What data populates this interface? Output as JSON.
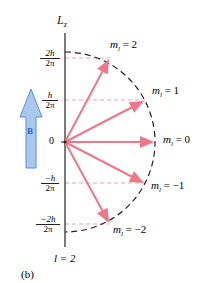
{
  "diagram": {
    "axis_label": "L",
    "axis_label_sub": "z",
    "field_label": "B",
    "quantum_number_label": "l = 2",
    "panel_label": "(b)",
    "tick_labels": [
      {
        "num": "2h",
        "den": "2π",
        "value": 2
      },
      {
        "num": "h",
        "den": "2π",
        "value": 1
      },
      {
        "num": "0",
        "den": "",
        "value": 0
      },
      {
        "num": "−h",
        "den": "2π",
        "value": -1
      },
      {
        "num": "−2h",
        "den": "2π",
        "value": -2
      }
    ],
    "vectors": [
      {
        "m_label": "m",
        "sub": "l",
        "eq": "= 2",
        "m": 2
      },
      {
        "m_label": "m",
        "sub": "l",
        "eq": "= 1",
        "m": 1
      },
      {
        "m_label": "m",
        "sub": "l",
        "eq": "= 0",
        "m": 0
      },
      {
        "m_label": "m",
        "sub": "l",
        "eq": "= −1",
        "m": -1
      },
      {
        "m_label": "m",
        "sub": "l",
        "eq": "= −2",
        "m": -2
      }
    ],
    "colors": {
      "vector": "#f0778a",
      "dashed_guides": "#f3a0ad",
      "circle": "#222222",
      "axis": "#222222",
      "field_arrow_fill": "#a9c8ee",
      "field_arrow_stroke": "#5b8fd0",
      "field_label": "#2a66c4"
    }
  }
}
